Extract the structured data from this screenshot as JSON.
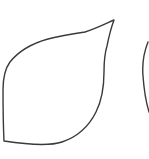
{
  "canvas": {
    "width": 149,
    "height": 159,
    "background": "#ffffff"
  },
  "shapes": [
    {
      "name": "leaf-outline",
      "stroke": "#3a3a3a",
      "stroke_width": 1.4,
      "path": "M114,20 C111,28 109,36 107,46 C104,56 104,64 104,72 C104,86 102,100 96,112 C90,124 80,136 62,142 C50,146 30,145 4,141 C3,120 3,100 3,90 C3,80 4,70 10,62 C18,52 30,44 48,39 C60,36 72,34 85,32 C95,29 105,24 114,20 Z"
    },
    {
      "name": "partial-arc-right",
      "stroke": "#3a3a3a",
      "stroke_width": 1.4,
      "path": "M148,42 C144,52 142,64 143,76 C144,90 146,102 149,112"
    }
  ]
}
